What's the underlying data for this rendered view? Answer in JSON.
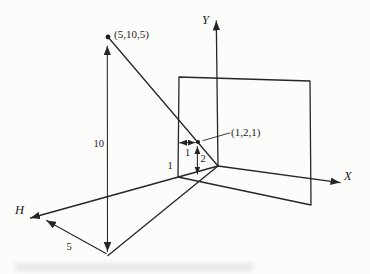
{
  "diagram": {
    "description_colors": {
      "ink": "#262626",
      "paper": "#fcfcfa"
    },
    "axes": {
      "y_label": "Y",
      "x_label": "X",
      "h_label": "H"
    },
    "points": {
      "space_point_label": "(5,10,5)",
      "screen_point_label": "(1,2,1)"
    },
    "dimensions": {
      "height_along_y": "10",
      "distance_along_h": "5",
      "plane_offset_along_h": "1",
      "screen_x_offset": "1",
      "screen_y_offset": "2"
    }
  }
}
